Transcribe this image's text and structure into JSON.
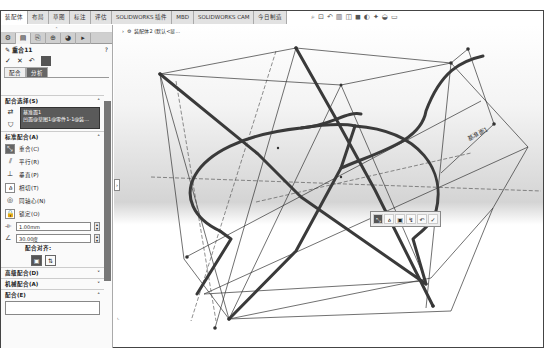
{
  "command_tabs": [
    {
      "label": "装配体",
      "active": true
    },
    {
      "label": "布局",
      "active": false
    },
    {
      "label": "草图",
      "active": false
    },
    {
      "label": "标注",
      "active": false
    },
    {
      "label": "评估",
      "active": false
    },
    {
      "label": "SOLIDWORKS 插件",
      "active": false
    },
    {
      "label": "MBD",
      "active": false
    },
    {
      "label": "SOLIDWORKS CAM",
      "active": false
    },
    {
      "label": "今日制造",
      "active": false
    }
  ],
  "heads_up_toolbar": [
    "search-zoom-icon",
    "zoom-area-icon",
    "previous-view-icon",
    "section-view-icon",
    "view-orientation-icon",
    "display-style-icon",
    "hide-show-icon",
    "appearance-icon",
    "scene-icon",
    "display-settings-icon"
  ],
  "panel": {
    "collapse_glyph": "˄",
    "manager_tabs": [
      "feature-manager",
      "property-manager",
      "config-manager",
      "dimxpert-manager",
      "display-manager",
      "more"
    ],
    "title": "重合11",
    "help_glyph": "?",
    "actions": {
      "ok": "✓",
      "cancel": "✕",
      "undo": "↶"
    },
    "sub_tabs": [
      {
        "label": "配合",
        "active": true
      },
      {
        "label": "分析",
        "active": false
      }
    ],
    "mate_selections": {
      "header": "配合选择(S)",
      "items": [
        "基准面1",
        "凹面@草图1@零件1-1@装..."
      ]
    },
    "standard_mates": {
      "header": "标准配合(A)",
      "items": [
        {
          "label": "重合(C)",
          "selected": true,
          "icon": "coincident"
        },
        {
          "label": "平行(R)",
          "selected": false,
          "icon": "parallel"
        },
        {
          "label": "垂直(P)",
          "selected": false,
          "icon": "perpendicular"
        },
        {
          "label": "相切(T)",
          "selected": false,
          "icon": "tangent"
        },
        {
          "label": "同轴心(N)",
          "selected": false,
          "icon": "concentric"
        },
        {
          "label": "锁定(O)",
          "selected": false,
          "icon": "lock"
        }
      ],
      "distance_value": "1.00mm",
      "angle_value": "30.00度",
      "alignment_label": "配合对齐:"
    },
    "advanced_mates": "高级配合(D)",
    "mechanical_mates": "机械配合(A)",
    "mates": "配合(E)"
  },
  "viewport": {
    "breadcrumb": "装配体2 (默认<显...",
    "plane_label": "基准面1",
    "side_handle": "›",
    "context_toolbar": [
      "coincident",
      "tangent",
      "lock",
      "flip",
      "undo",
      "ok"
    ]
  }
}
